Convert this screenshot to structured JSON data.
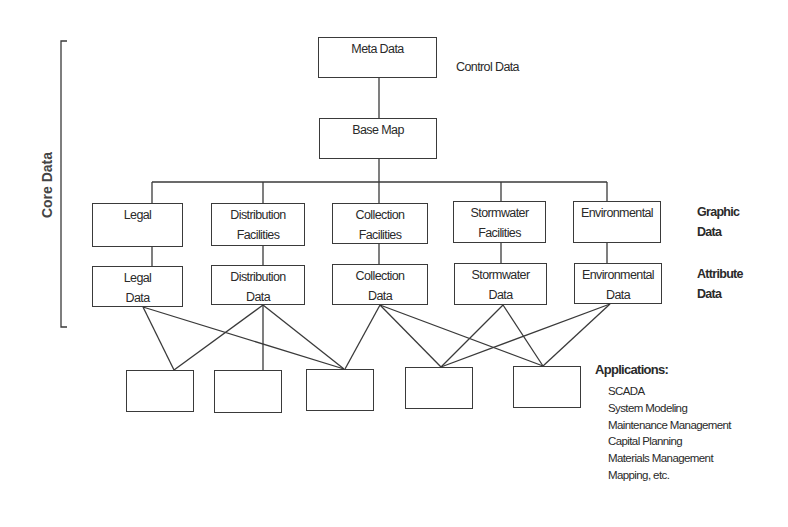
{
  "bracket_label": "Core Data",
  "top": {
    "meta": "Meta Data",
    "control_label": "Control Data",
    "base": "Base Map"
  },
  "graphic_boxes": [
    {
      "line1": "Legal",
      "line2": ""
    },
    {
      "line1": "Distribution",
      "line2": "Facilities"
    },
    {
      "line1": "Collection",
      "line2": "Facilities"
    },
    {
      "line1": "Stormwater",
      "line2": "Facilities"
    },
    {
      "line1": "Environmental",
      "line2": ""
    }
  ],
  "attribute_boxes": [
    {
      "line1": "Legal",
      "line2": "Data"
    },
    {
      "line1": "Distribution",
      "line2": "Data"
    },
    {
      "line1": "Collection",
      "line2": "Data"
    },
    {
      "line1": "Stormwater",
      "line2": "Data"
    },
    {
      "line1": "Environmental",
      "line2": "Data"
    }
  ],
  "side_labels": {
    "graphic": {
      "line1": "Graphic",
      "line2": "Data"
    },
    "attribute": {
      "line1": "Attribute",
      "line2": "Data"
    }
  },
  "applications": {
    "title": "Applications:",
    "items": [
      "SCADA",
      "System Modeling",
      "Maintenance Management",
      "Capital Planning",
      "Materials Management",
      "Mapping, etc."
    ]
  }
}
